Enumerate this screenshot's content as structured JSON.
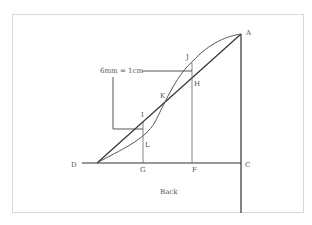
{
  "diagram": {
    "title": "Back",
    "scale_note": "6mm = 1cm",
    "colors": {
      "frame": "#d8d8d8",
      "line": "#333333",
      "thin": "#666666",
      "label": "#555555"
    },
    "points": {
      "A": {
        "label": "A"
      },
      "C": {
        "label": "C"
      },
      "D": {
        "label": "D"
      },
      "G": {
        "label": "G"
      },
      "F": {
        "label": "F"
      },
      "K": {
        "label": "K"
      },
      "J": {
        "label": "J"
      },
      "H": {
        "label": "H"
      },
      "I": {
        "label": "I"
      },
      "L": {
        "label": "L"
      }
    }
  }
}
